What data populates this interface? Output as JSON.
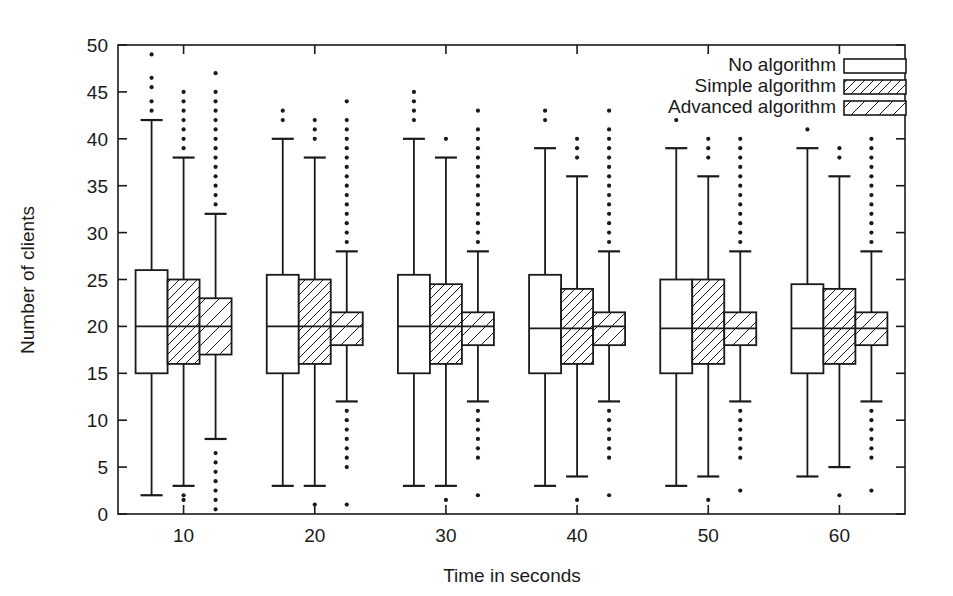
{
  "chart_data": {
    "type": "box",
    "title": "",
    "xlabel": "Time in seconds",
    "ylabel": "Number of clients",
    "xtick_labels": [
      "10",
      "20",
      "30",
      "40",
      "50",
      "60"
    ],
    "xticks": [
      10,
      20,
      30,
      40,
      50,
      60
    ],
    "ytick_labels": [
      "0",
      "5",
      "10",
      "15",
      "20",
      "25",
      "30",
      "35",
      "40",
      "45",
      "50"
    ],
    "yticks": [
      0,
      5,
      10,
      15,
      20,
      25,
      30,
      35,
      40,
      45,
      50
    ],
    "ylim": [
      0,
      50
    ],
    "xlim": [
      5,
      65
    ],
    "grid": false,
    "legend_position": "top-right",
    "legend": [
      {
        "label": "No algorithm",
        "fill": "none"
      },
      {
        "label": "Simple algorithm",
        "fill": "diagonal-hatch"
      },
      {
        "label": "Advanced algorithm",
        "fill": "diagonal-hatch-wide"
      }
    ],
    "series": [
      {
        "name": "No algorithm",
        "fill": "none",
        "boxes": [
          {
            "category": "10",
            "q1": 15,
            "median": 20,
            "q3": 26,
            "whisker_low": 2,
            "whisker_high": 42,
            "outliers_high": [
              43,
              44,
              45.5,
              46.5,
              49
            ],
            "outliers_low": []
          },
          {
            "category": "20",
            "q1": 15,
            "median": 20,
            "q3": 25.5,
            "whisker_low": 3,
            "whisker_high": 40,
            "outliers_high": [
              42,
              43
            ],
            "outliers_low": []
          },
          {
            "category": "30",
            "q1": 15,
            "median": 20,
            "q3": 25.5,
            "whisker_low": 3,
            "whisker_high": 40,
            "outliers_high": [
              42,
              43,
              44,
              45
            ],
            "outliers_low": []
          },
          {
            "category": "40",
            "q1": 15,
            "median": 19.8,
            "q3": 25.5,
            "whisker_low": 3,
            "whisker_high": 39,
            "outliers_high": [
              42,
              43
            ],
            "outliers_low": []
          },
          {
            "category": "50",
            "q1": 15,
            "median": 19.8,
            "q3": 25,
            "whisker_low": 3,
            "whisker_high": 39,
            "outliers_high": [
              42
            ],
            "outliers_low": []
          },
          {
            "category": "60",
            "q1": 15,
            "median": 19.8,
            "q3": 24.5,
            "whisker_low": 4,
            "whisker_high": 39,
            "outliers_high": [
              41
            ],
            "outliers_low": []
          }
        ]
      },
      {
        "name": "Simple algorithm",
        "fill": "diagonal-hatch",
        "boxes": [
          {
            "category": "10",
            "q1": 16,
            "median": 20,
            "q3": 25,
            "whisker_low": 3,
            "whisker_high": 38,
            "outliers_high": [
              39,
              40,
              41,
              42,
              43,
              44,
              45
            ],
            "outliers_low": [
              1.5,
              2
            ]
          },
          {
            "category": "20",
            "q1": 16,
            "median": 20,
            "q3": 25,
            "whisker_low": 3,
            "whisker_high": 38,
            "outliers_high": [
              40,
              41,
              42
            ],
            "outliers_low": [
              1
            ]
          },
          {
            "category": "30",
            "q1": 16,
            "median": 20,
            "q3": 24.5,
            "whisker_low": 3,
            "whisker_high": 38,
            "outliers_high": [
              40
            ],
            "outliers_low": [
              1.5
            ]
          },
          {
            "category": "40",
            "q1": 16,
            "median": 19.8,
            "q3": 24,
            "whisker_low": 4,
            "whisker_high": 36,
            "outliers_high": [
              38,
              39,
              40
            ],
            "outliers_low": [
              1.5
            ]
          },
          {
            "category": "50",
            "q1": 16,
            "median": 19.8,
            "q3": 25,
            "whisker_low": 4,
            "whisker_high": 36,
            "outliers_high": [
              38,
              39,
              40
            ],
            "outliers_low": [
              1.5
            ]
          },
          {
            "category": "60",
            "q1": 16,
            "median": 19.8,
            "q3": 24,
            "whisker_low": 5,
            "whisker_high": 36,
            "outliers_high": [
              38,
              39
            ],
            "outliers_low": [
              2
            ]
          }
        ]
      },
      {
        "name": "Advanced algorithm",
        "fill": "diagonal-hatch-wide",
        "boxes": [
          {
            "category": "10",
            "q1": 17,
            "median": 20,
            "q3": 23,
            "whisker_low": 8,
            "whisker_high": 32,
            "outliers_high": [
              33,
              34,
              35,
              36,
              37,
              38,
              39,
              40,
              41,
              42,
              43,
              44,
              45,
              47
            ],
            "outliers_low": [
              0.5,
              1.5,
              2.5,
              3.5,
              4.5,
              5.5,
              6.5
            ]
          },
          {
            "category": "20",
            "q1": 18,
            "median": 20,
            "q3": 21.5,
            "whisker_low": 12,
            "whisker_high": 28,
            "outliers_high": [
              29,
              30,
              31,
              32,
              33,
              34,
              35,
              36,
              37,
              38,
              39,
              40,
              41,
              42,
              44
            ],
            "outliers_low": [
              5,
              6,
              7,
              8,
              9,
              10,
              11,
              1
            ]
          },
          {
            "category": "30",
            "q1": 18,
            "median": 20,
            "q3": 21.5,
            "whisker_low": 12,
            "whisker_high": 28,
            "outliers_high": [
              29,
              30,
              31,
              32,
              33,
              34,
              35,
              36,
              37,
              38,
              39,
              40,
              41,
              43
            ],
            "outliers_low": [
              6,
              7,
              8,
              9,
              10,
              11,
              2
            ]
          },
          {
            "category": "40",
            "q1": 18,
            "median": 20,
            "q3": 21.5,
            "whisker_low": 12,
            "whisker_high": 28,
            "outliers_high": [
              29,
              30,
              31,
              32,
              33,
              34,
              35,
              36,
              37,
              38,
              39,
              40,
              41,
              43
            ],
            "outliers_low": [
              6,
              7,
              8,
              9,
              10,
              11,
              2
            ]
          },
          {
            "category": "50",
            "q1": 18,
            "median": 19.8,
            "q3": 21.5,
            "whisker_low": 12,
            "whisker_high": 28,
            "outliers_high": [
              29,
              30,
              31,
              32,
              33,
              34,
              35,
              36,
              37,
              38,
              39,
              40
            ],
            "outliers_low": [
              6,
              7,
              8,
              9,
              10,
              11,
              2.5
            ]
          },
          {
            "category": "60",
            "q1": 18,
            "median": 19.8,
            "q3": 21.5,
            "whisker_low": 12,
            "whisker_high": 28,
            "outliers_high": [
              29,
              30,
              31,
              32,
              33,
              34,
              35,
              36,
              37,
              38,
              39,
              40
            ],
            "outliers_low": [
              6,
              7,
              8,
              9,
              10,
              11,
              2.5
            ]
          }
        ]
      }
    ],
    "colors": {
      "axis": "#1a1a1a",
      "box_stroke": "#1a1a1a",
      "background": "#ffffff"
    }
  }
}
